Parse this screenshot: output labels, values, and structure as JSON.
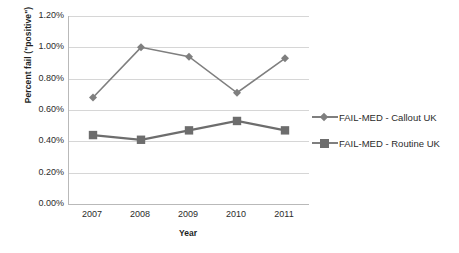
{
  "chart_data": {
    "type": "line",
    "title": "",
    "xlabel": "Year",
    "ylabel": "Percent fail (\"positive\")",
    "categories": [
      "2007",
      "2008",
      "2009",
      "2010",
      "2011"
    ],
    "x": [
      2007,
      2008,
      2009,
      2010,
      2011
    ],
    "series": [
      {
        "name": "FAIL-MED - Callout UK",
        "marker": "diamond",
        "color": "#7f7f7f",
        "values": [
          0.68,
          1.0,
          0.94,
          0.71,
          0.93
        ]
      },
      {
        "name": "FAIL-MED - Routine UK",
        "marker": "square",
        "color": "#6d6d6d",
        "values": [
          0.44,
          0.41,
          0.47,
          0.53,
          0.47
        ]
      }
    ],
    "ylim": [
      0.0,
      1.2
    ],
    "ytick_values": [
      0.0,
      0.2,
      0.4,
      0.6,
      0.8,
      1.0,
      1.2
    ],
    "ytick_labels": [
      "0.00%",
      "0.20%",
      "0.40%",
      "0.60%",
      "0.80%",
      "1.00%",
      "1.20%"
    ],
    "value_suffix": "%",
    "grid": true,
    "legend_position": "right"
  },
  "legend": {
    "items": [
      {
        "label": "FAIL-MED - Callout UK"
      },
      {
        "label": "FAIL-MED - Routine UK"
      }
    ]
  },
  "colors": {
    "series_1": "#7f7f7f",
    "series_2": "#6d6d6d",
    "gridline": "#d6d6d6",
    "axis": "#b9b9b9",
    "text": "#2b2b2b",
    "background": "#ffffff"
  }
}
